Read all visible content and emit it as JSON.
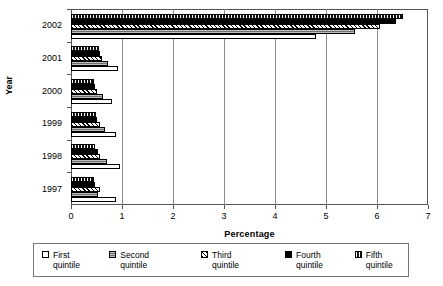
{
  "chart_data": {
    "type": "bar",
    "orientation": "horizontal",
    "title": "",
    "xlabel": "Percentage",
    "ylabel": "Year",
    "xlim": [
      0,
      7
    ],
    "xticks": [
      0,
      1,
      2,
      3,
      4,
      5,
      6,
      7
    ],
    "grid": true,
    "legend_position": "bottom",
    "categories": [
      "1997",
      "1998",
      "1999",
      "2000",
      "2001",
      "2002"
    ],
    "series": [
      {
        "name": "First quintile",
        "key": "q1",
        "values": [
          0.88,
          0.96,
          0.89,
          0.8,
          0.92,
          4.8
        ]
      },
      {
        "name": "Second quintile",
        "key": "q2",
        "values": [
          0.52,
          0.7,
          0.66,
          0.63,
          0.72,
          5.57
        ]
      },
      {
        "name": "Third quintile",
        "key": "q3",
        "values": [
          0.57,
          0.56,
          0.56,
          0.5,
          0.6,
          6.05
        ]
      },
      {
        "name": "Fourth quintile",
        "key": "q4",
        "values": [
          0.48,
          0.52,
          0.51,
          0.47,
          0.56,
          6.37
        ]
      },
      {
        "name": "Fifth quintile",
        "key": "q5",
        "values": [
          0.45,
          0.48,
          0.49,
          0.45,
          0.55,
          6.5
        ]
      }
    ]
  },
  "axis": {
    "x_title": "Percentage",
    "y_title": "Year",
    "x_tick_labels": [
      "0",
      "1",
      "2",
      "3",
      "4",
      "5",
      "6",
      "7"
    ],
    "y_tick_labels": [
      "2002",
      "2001",
      "2000",
      "1999",
      "1998",
      "1997"
    ]
  },
  "legend": {
    "items": [
      {
        "label": "First quintile",
        "key": "q1"
      },
      {
        "label": "Second\nquintile",
        "key": "q2"
      },
      {
        "label": "Third\nquintile",
        "key": "q3"
      },
      {
        "label": "Fourth quintile",
        "key": "q4"
      },
      {
        "label": "Fifth quintile",
        "key": "q5"
      }
    ]
  },
  "colors": {
    "axis": "#555555",
    "grid": "#8a8a8a",
    "q1": "#ffffff",
    "q2": "#6f6f6f",
    "q3": "#ffffff",
    "q4": "#000000",
    "q5": "#111111"
  }
}
